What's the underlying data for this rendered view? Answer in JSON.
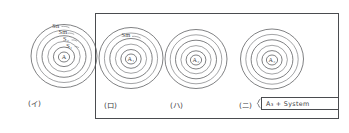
{
  "figure": {
    "type": "hand-drawn schematic",
    "ink_color": "#55575a",
    "frame_color": "#4a4c4f",
    "background": "#ffffff",
    "panels": [
      {
        "caption": "(イ)",
        "core_label": "A",
        "ring_count": 5,
        "ring_labels": [
          "S₁",
          "S₂",
          "Sm",
          "Sn"
        ],
        "ring_labels_plain": [
          "S1",
          "S2",
          "Sm",
          "Sn"
        ],
        "boxed": false,
        "annotation": ""
      },
      {
        "caption": "(ロ)",
        "core_label": "A₁",
        "core_label_plain": "A1",
        "ring_count": 5,
        "ring_labels": [
          "Sm"
        ],
        "ring_labels_plain": [
          "Sm"
        ],
        "boxed": true,
        "annotation": ""
      },
      {
        "caption": "(ハ)",
        "core_label": "A₂",
        "core_label_plain": "A2",
        "ring_count": 5,
        "ring_labels": [],
        "ring_labels_plain": [],
        "boxed": true,
        "annotation": ""
      },
      {
        "caption": "(ニ)",
        "core_label": "A₃",
        "core_label_plain": "A3",
        "ring_count": 5,
        "ring_labels": [],
        "ring_labels_plain": [],
        "boxed": true,
        "annotation": "A₃ + System",
        "annotation_plain": "A3 + System"
      }
    ],
    "enclosure": {
      "label": "grouping-frame",
      "contains": [
        "(ロ)",
        "(ハ)",
        "(ニ)"
      ]
    }
  }
}
